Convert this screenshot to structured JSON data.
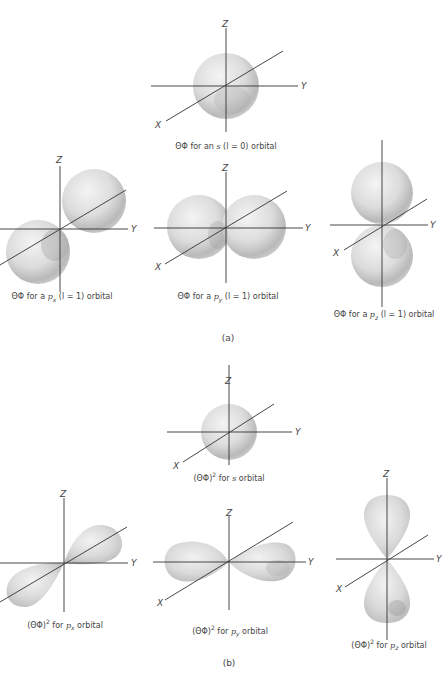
{
  "figure": {
    "panel_a": {
      "label": "(a)",
      "diagrams": [
        {
          "id": "a-s",
          "caption_prefix": "ΘΦ for an ",
          "orbital": "s",
          "caption_suffix": " (l = 0) orbital"
        },
        {
          "id": "a-px",
          "caption_prefix": "ΘΦ for a ",
          "orbital": "p",
          "subscript": "x",
          "caption_suffix": " (l = 1) orbital"
        },
        {
          "id": "a-py",
          "caption_prefix": "ΘΦ for a ",
          "orbital": "p",
          "subscript": "y",
          "caption_suffix": " (l = 1) orbital"
        },
        {
          "id": "a-pz",
          "caption_prefix": "ΘΦ for a ",
          "orbital": "p",
          "subscript": "z",
          "caption_suffix": " (l = 1) orbital"
        }
      ]
    },
    "panel_b": {
      "label": "(b)",
      "diagrams": [
        {
          "id": "b-s",
          "caption_prefix": "(ΘΦ)",
          "superscript": "2",
          "caption_mid": " for ",
          "orbital": "s",
          "caption_suffix": " orbital"
        },
        {
          "id": "b-px",
          "caption_prefix": "(ΘΦ)",
          "superscript": "2",
          "caption_mid": " for ",
          "orbital": "p",
          "subscript": "x",
          "caption_suffix": " orbital"
        },
        {
          "id": "b-py",
          "caption_prefix": "(ΘΦ)",
          "superscript": "2",
          "caption_mid": " for ",
          "orbital": "p",
          "subscript": "y",
          "caption_suffix": " orbital"
        },
        {
          "id": "b-pz",
          "caption_prefix": "(ΘΦ)",
          "superscript": "2",
          "caption_mid": " for ",
          "orbital": "p",
          "subscript": "z",
          "caption_suffix": " orbital"
        }
      ]
    },
    "axis_labels": {
      "x": "X",
      "y": "Y",
      "z": "Z"
    }
  }
}
